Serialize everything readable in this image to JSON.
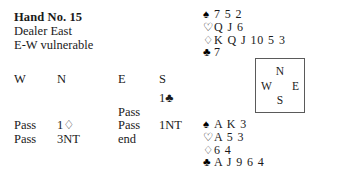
{
  "header": {
    "title": "Hand No. 15",
    "dealer": "Dealer East",
    "vulnerability": "E-W vulnerable"
  },
  "auction": {
    "columns": [
      "W",
      "N",
      "E",
      "S"
    ],
    "rows": [
      {
        "w": "",
        "n": "",
        "e": "",
        "s": "1♣"
      },
      {
        "w": "",
        "n": "",
        "e": "Pass",
        "s": ""
      },
      {
        "w": "Pass",
        "n": "1♢",
        "e": "Pass",
        "s": "1NT"
      },
      {
        "w": "Pass",
        "n": "3NT",
        "e": "end",
        "s": ""
      }
    ]
  },
  "compass": {
    "north": "N",
    "west": "W",
    "east": "E",
    "south": "S"
  },
  "hands": {
    "north": {
      "label": "North hand",
      "suits": [
        {
          "symbol": "♠",
          "name": "spade-symbol",
          "color": "black",
          "cards": "7 5 2"
        },
        {
          "symbol": "♡",
          "name": "heart-symbol",
          "color": "red",
          "cards": "Q J 6"
        },
        {
          "symbol": "♢",
          "name": "diamond-symbol",
          "color": "red",
          "cards": "K Q J 10 5 3"
        },
        {
          "symbol": "♣",
          "name": "club-symbol",
          "color": "black",
          "cards": "7"
        }
      ]
    },
    "south": {
      "label": "South hand",
      "suits": [
        {
          "symbol": "♠",
          "name": "spade-symbol",
          "color": "black",
          "cards": "A K 3"
        },
        {
          "symbol": "♡",
          "name": "heart-symbol",
          "color": "red",
          "cards": "A 5 3"
        },
        {
          "symbol": "♢",
          "name": "diamond-symbol",
          "color": "red",
          "cards": "6 4"
        },
        {
          "symbol": "♣",
          "name": "club-symbol",
          "color": "black",
          "cards": "A J 9 6 4"
        }
      ]
    }
  },
  "colors": {
    "text": "#1a1a1a",
    "background": "#ffffff",
    "box_border": "#5a5a5a"
  }
}
